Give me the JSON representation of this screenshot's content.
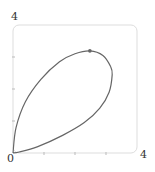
{
  "chart_data": {
    "type": "line",
    "title": "",
    "xlabel": "",
    "ylabel": "",
    "xlim": [
      0,
      4
    ],
    "ylim": [
      0,
      4
    ],
    "x_tick_labels": {
      "min": "0",
      "max": "4"
    },
    "y_tick_labels": {
      "max": "4"
    },
    "x_ticks": [
      1,
      2,
      3
    ],
    "y_ticks": [
      1,
      2,
      3
    ],
    "grid": false,
    "legend": null,
    "series": [
      {
        "name": "closed loop curve",
        "points": [
          [
            0,
            0
          ],
          [
            0.1,
            0.8
          ],
          [
            0.4,
            1.6
          ],
          [
            0.9,
            2.3
          ],
          [
            1.5,
            2.85
          ],
          [
            2.0,
            3.1
          ],
          [
            2.48,
            3.19
          ],
          [
            2.9,
            3.05
          ],
          [
            3.15,
            2.7
          ],
          [
            3.2,
            2.45
          ],
          [
            3.1,
            1.9
          ],
          [
            2.8,
            1.4
          ],
          [
            2.3,
            0.95
          ],
          [
            1.6,
            0.55
          ],
          [
            0.8,
            0.2
          ],
          [
            0.2,
            0.03
          ],
          [
            0,
            0
          ]
        ],
        "color": "#666666"
      }
    ],
    "markers": [
      {
        "label": "peak point",
        "x": 2.48,
        "y": 3.19
      }
    ]
  },
  "labels": {
    "y_max": "4",
    "origin": "0",
    "x_max": "4"
  }
}
